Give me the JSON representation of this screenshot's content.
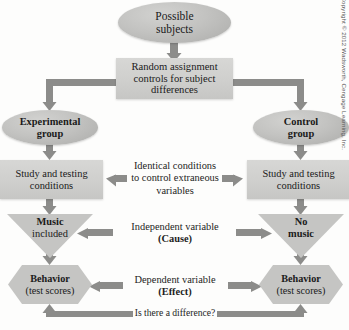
{
  "figure": {
    "copyright": "Copyright © 2012 Wadsworth, Cengage Learning, Inc.",
    "palette": {
      "node_fill": "#c9c9c7",
      "node_fill_dark": "#b5b5b3",
      "arrow": "#8c8c8a",
      "text": "#1a1a1a",
      "background": "#fdfdfc"
    }
  },
  "nodes": {
    "possible_subjects": {
      "line1": "Possible",
      "line2": "subjects",
      "shape": "oval"
    },
    "random_assignment": {
      "line1": "Random assignment",
      "line2": "controls for subject",
      "line3": "differences",
      "shape": "rect"
    },
    "experimental_group": {
      "line1": "Experimental",
      "line2": "group",
      "shape": "oval"
    },
    "control_group": {
      "line1": "Control",
      "line2": "group",
      "shape": "oval"
    },
    "study_testing_left": {
      "line1": "Study and testing",
      "line2": "conditions",
      "shape": "rect"
    },
    "study_testing_right": {
      "line1": "Study and testing",
      "line2": "conditions",
      "shape": "rect"
    },
    "music_included": {
      "line1": "Music",
      "line2": "included",
      "shape": "inverted-triangle"
    },
    "no_music": {
      "line1": "No",
      "line2": "music",
      "shape": "inverted-triangle"
    },
    "behavior_left": {
      "line1": "Behavior",
      "line2": "(test scores)",
      "shape": "hexagon"
    },
    "behavior_right": {
      "line1": "Behavior",
      "line2": "(test scores)",
      "shape": "hexagon"
    }
  },
  "labels": {
    "identical_conditions": {
      "line1": "Identical conditions",
      "line2": "to control extraneous",
      "line3": "variables"
    },
    "independent_variable": {
      "line1": "Independent variable",
      "line2": "(Cause)"
    },
    "dependent_variable": {
      "line1": "Dependent variable",
      "line2": "(Effect)"
    },
    "difference_question": {
      "line1": "Is there a difference?"
    }
  },
  "diagram_flow": [
    {
      "from": "possible_subjects",
      "to": "random_assignment",
      "direction": "down"
    },
    {
      "from": "random_assignment",
      "to": "experimental_group",
      "direction": "left-down"
    },
    {
      "from": "random_assignment",
      "to": "control_group",
      "direction": "right-down"
    },
    {
      "from": "experimental_group",
      "to": "study_testing_left",
      "direction": "down"
    },
    {
      "from": "control_group",
      "to": "study_testing_right",
      "direction": "down"
    },
    {
      "from": "identical_conditions",
      "to": "study_testing_left",
      "direction": "left"
    },
    {
      "from": "identical_conditions",
      "to": "study_testing_right",
      "direction": "right"
    },
    {
      "from": "study_testing_left",
      "to": "music_included",
      "direction": "down"
    },
    {
      "from": "study_testing_right",
      "to": "no_music",
      "direction": "down"
    },
    {
      "from": "independent_variable",
      "to": "music_included",
      "direction": "left"
    },
    {
      "from": "independent_variable",
      "to": "no_music",
      "direction": "right"
    },
    {
      "from": "music_included",
      "to": "behavior_left",
      "direction": "down"
    },
    {
      "from": "no_music",
      "to": "behavior_right",
      "direction": "down"
    },
    {
      "from": "dependent_variable",
      "to": "behavior_left",
      "direction": "left"
    },
    {
      "from": "dependent_variable",
      "to": "behavior_right",
      "direction": "right"
    },
    {
      "from": "difference_question",
      "to": "behavior_left",
      "direction": "up-left"
    },
    {
      "from": "difference_question",
      "to": "behavior_right",
      "direction": "up-right"
    }
  ]
}
